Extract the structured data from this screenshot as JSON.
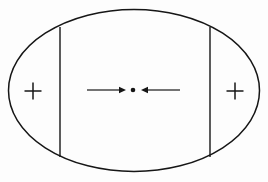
{
  "figure": {
    "title": "Ellipse with two vertical chords, plus markers and opposing arrows",
    "background_color": "#fdfdfd",
    "ink_color": "#161616",
    "width": 268,
    "height": 182
  },
  "shapes": {
    "ellipse": {
      "name": "outer-ellipse",
      "cx": 134,
      "cy": 90.5,
      "rx": 125.5,
      "ry": 81,
      "stroke_width": 1.5,
      "fill": "none"
    },
    "chords": [
      {
        "name": "left-vertical-chord",
        "x": 60,
        "y1": 27,
        "y2": 157,
        "stroke_width": 1.4
      },
      {
        "name": "right-vertical-chord",
        "x": 210,
        "y1": 27,
        "y2": 157,
        "stroke_width": 1.4
      }
    ],
    "plus_markers": [
      {
        "name": "left-plus-marker",
        "label": "+",
        "cx": 33,
        "cy": 91,
        "arm": 8.5,
        "stroke_width": 1.5
      },
      {
        "name": "right-plus-marker",
        "label": "+",
        "cx": 235,
        "cy": 91,
        "arm": 8.5,
        "stroke_width": 1.5
      }
    ],
    "center_dot": {
      "name": "center-point-dot",
      "cx": 133,
      "cy": 90,
      "r": 2.3
    },
    "arrows": [
      {
        "name": "left-arrow-pointing-right",
        "direction": "right",
        "tail_x": 87,
        "tip_x": 126,
        "y": 90,
        "stroke_width": 1.2,
        "head_length": 7,
        "head_half_width": 3.2
      },
      {
        "name": "right-arrow-pointing-left",
        "direction": "left",
        "tail_x": 180,
        "tip_x": 141,
        "y": 90,
        "stroke_width": 1.2,
        "head_length": 7,
        "head_half_width": 3.2
      }
    ]
  }
}
